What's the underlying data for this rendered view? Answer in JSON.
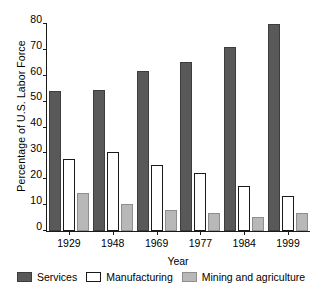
{
  "chart_data": {
    "type": "bar",
    "title": "",
    "xlabel": "Year",
    "ylabel": "Percentage of U.S. Labor Force",
    "categories": [
      "1929",
      "1948",
      "1969",
      "1977",
      "1984",
      "1999"
    ],
    "series": [
      {
        "name": "Services",
        "color": "#595959",
        "values": [
          54,
          54.5,
          62,
          65.5,
          71,
          80
        ]
      },
      {
        "name": "Manufacturing",
        "color": "#ffffff",
        "values": [
          28,
          30.5,
          25.5,
          22.5,
          17.5,
          13.5
        ]
      },
      {
        "name": "Mining and agriculture",
        "color": "#b8b8b8",
        "values": [
          14.5,
          10.5,
          8,
          7,
          5.5,
          7
        ]
      }
    ],
    "ylim": [
      0,
      80
    ],
    "yticks": [
      0,
      10,
      20,
      30,
      40,
      50,
      60,
      70,
      80
    ],
    "ytick_labels": [
      "0",
      "10",
      "20",
      "30",
      "40",
      "50",
      "60",
      "70",
      "80"
    ],
    "grid": false,
    "legend_position": "bottom"
  }
}
